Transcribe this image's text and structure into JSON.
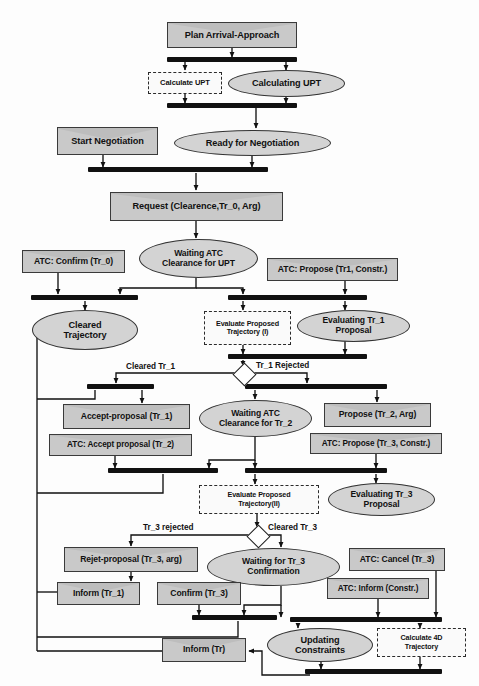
{
  "diagram": {
    "colors": {
      "signal_fill": "#c9c9c9",
      "state_fill": "#d3d3d3",
      "bar": "#111111",
      "stroke": "#333333",
      "background": "#ffffff"
    }
  },
  "nodes": {
    "plan_arrival_approach": "Plan Arrival-Approach",
    "calculate_upt": "Calculate UPT",
    "calculating_upt": "Calculating UPT",
    "start_negotiation": "Start Negotiation",
    "ready_for_negotiation": "Ready for Negotiation",
    "request_clearance": "Request (Clearence,Tr_0, Arg)",
    "waiting_atc_clearance_upt_l1": "Waiting ATC",
    "waiting_atc_clearance_upt_l2": "Clearance for UPT",
    "atc_confirm_tr0": "ATC: Confirm (Tr_0)",
    "atc_propose_tr1": "ATC: Propose (Tr1, Constr.)",
    "cleared_trajectory_l1": "Cleared",
    "cleared_trajectory_l2": "Trajectory",
    "evaluate_proposed_traj_1_l1": "Evaluate Proposed",
    "evaluate_proposed_traj_1_l2": "Trajectory (I)",
    "evaluating_tr1_l1": "Evaluating Tr_1",
    "evaluating_tr1_l2": "Proposal",
    "accept_proposal_tr1": "Accept-proposal  (Tr_1)",
    "atc_accept_proposal_tr2": "ATC: Accept proposal (Tr_2)",
    "waiting_atc_clearance_tr2_l1": "Waiting ATC",
    "waiting_atc_clearance_tr2_l2": "Clearance for Tr_2",
    "propose_tr2_arg": "Propose (Tr_2, Arg)",
    "atc_propose_tr3": "ATC: Propose (Tr_3, Constr.)",
    "evaluate_proposed_traj_2_l1": "Evaluate Proposed",
    "evaluate_proposed_traj_2_l2": "Trajectory(II)",
    "evaluating_tr3_l1": "Evaluating  Tr_3",
    "evaluating_tr3_l2": "Proposal",
    "reject_proposal_tr3": "Rejet-proposal (Tr_3, arg)",
    "waiting_tr3_confirmation_l1": "Waiting for Tr_3",
    "waiting_tr3_confirmation_l2": "Confirmation",
    "atc_cancel_tr3": "ATC: Cancel (Tr_3)",
    "atc_inform_constr": "ATC: Inform (Constr.)",
    "inform_tr1": "Inform (Tr_1)",
    "confirm_tr3": "Confirm (Tr_3)",
    "updating_constraints_l1": "Updating",
    "updating_constraints_l2": "Constraints",
    "calculate_4d_traj_l1": "Calculate 4D",
    "calculate_4d_traj_l2": "Trajectory",
    "inform_tr": "Inform (Tr)"
  },
  "edge_labels": {
    "cleared_tr1": "Cleared Tr_1",
    "tr1_rejected": "Tr_1 Rejected",
    "tr3_rejected": "Tr_3 rejected",
    "cleared_tr3": "Cleared Tr_3"
  }
}
